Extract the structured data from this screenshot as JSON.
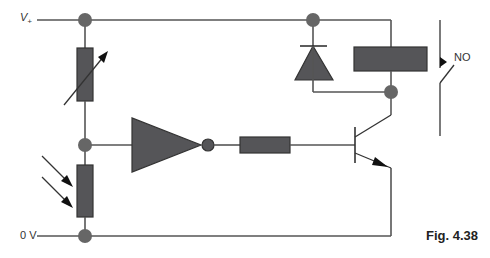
{
  "labels": {
    "supply_positive": "V+",
    "supply_positive_base": "V",
    "supply_positive_sub": "+",
    "ground": "0 V",
    "switch_type": "NO",
    "figure_caption": "Fig. 4.38"
  },
  "components": [
    {
      "type": "variable-resistor",
      "position": "upper-left divider"
    },
    {
      "type": "light-dependent-resistor",
      "position": "lower-left divider"
    },
    {
      "type": "inverter",
      "position": "center"
    },
    {
      "type": "resistor",
      "position": "base resistor"
    },
    {
      "type": "npn-transistor",
      "position": "right"
    },
    {
      "type": "diode",
      "position": "flyback across relay coil"
    },
    {
      "type": "relay-coil",
      "position": "upper right"
    },
    {
      "type": "relay-switch",
      "contact": "normally open"
    }
  ],
  "colors": {
    "component_fill": "#555558",
    "wire": "#555555",
    "node": "#666666",
    "background": "#ffffff"
  }
}
